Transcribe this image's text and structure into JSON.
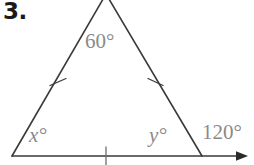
{
  "figure": {
    "problem_number": "3.",
    "type": "isosceles-triangle-with-exterior-angle",
    "stroke_color": "#3a3a3a",
    "label_color": "#8a8a8a",
    "background_color": "#ffffff",
    "vertices": {
      "apex": [
        106,
        -4
      ],
      "bottom_left": [
        12,
        156
      ],
      "bottom_right": [
        202,
        156
      ]
    },
    "ray_end": [
      248,
      156
    ],
    "tick_marks": [
      {
        "name": "left-side-tick",
        "x": 58,
        "y": 80
      },
      {
        "name": "right-side-tick",
        "x": 155,
        "y": 80
      },
      {
        "name": "base-tick",
        "x": 106,
        "y": 156
      }
    ],
    "labels": {
      "apex_angle": "60°",
      "left_angle": "x°",
      "right_angle": "y°",
      "exterior_angle": "120°"
    }
  }
}
